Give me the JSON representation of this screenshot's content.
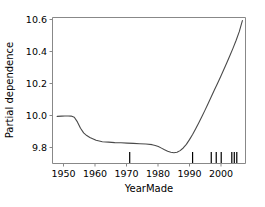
{
  "chart_data": {
    "type": "line",
    "title": "",
    "subtitle": "",
    "xlabel": "YearMade",
    "ylabel": "Partial dependence",
    "xlim": [
      1946,
      2008
    ],
    "ylim": [
      9.69,
      10.62
    ],
    "xticks": [
      1950,
      1960,
      1970,
      1980,
      1990,
      2000
    ],
    "xtick_labels": [
      "1950",
      "1960",
      "1970",
      "1980",
      "1990",
      "2000"
    ],
    "yticks": [
      9.8,
      10.0,
      10.2,
      10.4,
      10.6
    ],
    "ytick_labels": [
      "9.8",
      "10.0",
      "10.2",
      "10.4",
      "10.6"
    ],
    "grid": false,
    "legend": null,
    "line_color": "#4a4a4a",
    "line_width": 1.1,
    "series": [
      {
        "name": "Partial dependence",
        "x": [
          1947.5,
          1949,
          1950,
          1951,
          1952,
          1953,
          1954,
          1955,
          1956,
          1957,
          1958,
          1960,
          1962,
          1964,
          1966,
          1968,
          1970,
          1972,
          1974,
          1976,
          1978,
          1979,
          1980,
          1981,
          1982,
          1983,
          1984,
          1985,
          1986,
          1987,
          1988,
          1989,
          1990,
          1991,
          1992,
          1993,
          1994,
          1995,
          1996,
          1997,
          1998,
          1999,
          2000,
          2001,
          2002,
          2003,
          2004,
          2005,
          2006,
          2007
        ],
        "y": [
          9.99,
          9.992,
          9.993,
          9.993,
          9.992,
          9.985,
          9.955,
          9.915,
          9.885,
          9.868,
          9.856,
          9.838,
          9.829,
          9.826,
          9.823,
          9.822,
          9.82,
          9.818,
          9.816,
          9.814,
          9.81,
          9.805,
          9.798,
          9.788,
          9.777,
          9.768,
          9.762,
          9.759,
          9.762,
          9.772,
          9.789,
          9.812,
          9.842,
          9.875,
          9.912,
          9.95,
          9.99,
          10.03,
          10.072,
          10.115,
          10.158,
          10.2,
          10.243,
          10.287,
          10.332,
          10.378,
          10.425,
          10.475,
          10.53,
          10.6
        ]
      }
    ],
    "rug_marks": {
      "name": "deciles-rug",
      "values": [
        1970.8,
        1991.0,
        1997.0,
        1998.6,
        2000.2,
        2003.6,
        2004.4,
        2005.2
      ],
      "color": "#000000"
    }
  }
}
